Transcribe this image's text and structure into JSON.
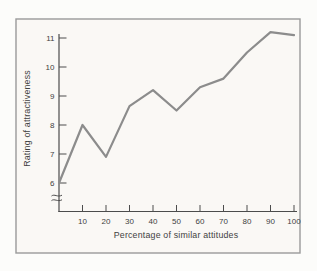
{
  "figure": {
    "background_outer": "#fcfcfa",
    "background_inner": "#faf8f5",
    "frame_border_color": "#9a9a9a"
  },
  "chart_data": {
    "type": "line",
    "title": "",
    "xlabel": "Percentage of similar attitudes",
    "ylabel": "Rating of attractiveness",
    "x": [
      0,
      10,
      20,
      30,
      40,
      50,
      60,
      70,
      80,
      90,
      100
    ],
    "y": [
      6.0,
      8.0,
      6.9,
      8.65,
      9.2,
      8.5,
      9.3,
      9.6,
      10.5,
      11.2,
      11.1
    ],
    "x_ticks": [
      10,
      20,
      30,
      40,
      50,
      60,
      70,
      80,
      90,
      100
    ],
    "y_ticks": [
      6,
      7,
      8,
      9,
      10,
      11
    ],
    "xlim": [
      0,
      100
    ],
    "ylim_shown": [
      6,
      11
    ],
    "y_axis_break": true,
    "grid": false,
    "line_color": "#8c8c8c",
    "axis_color": "#4c4c4c",
    "label_color": "#3f3f3f"
  }
}
